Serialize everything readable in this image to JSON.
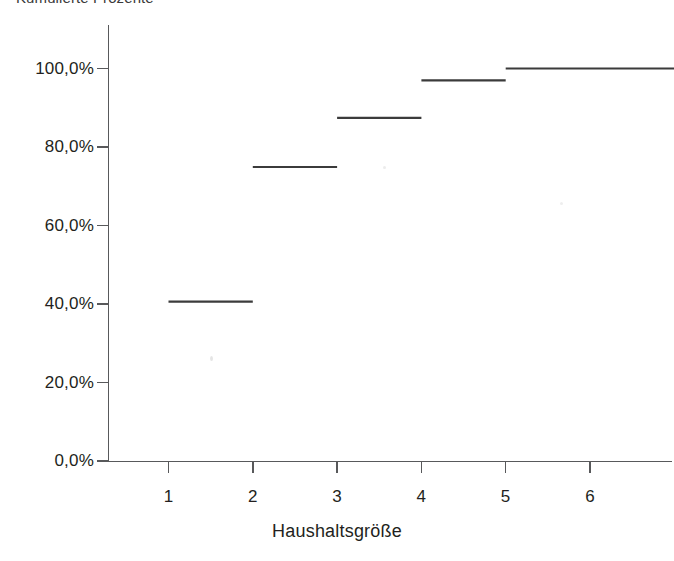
{
  "chart_data": {
    "type": "line",
    "subtype": "step",
    "title": "Kumulierte Prozente",
    "xlabel": "Haushaltsgröße",
    "ylabel": "",
    "categories": [
      "1",
      "2",
      "3",
      "4",
      "5",
      "6"
    ],
    "values": [
      40.6,
      74.9,
      87.4,
      97.0,
      100.0,
      100.0
    ],
    "x": [
      1,
      2,
      3,
      4,
      5,
      6
    ],
    "xlim": [
      0.5,
      6.9
    ],
    "ylim": [
      0,
      106
    ],
    "grid": false,
    "legend": null,
    "y_ticks": [
      0,
      20,
      40,
      60,
      80,
      100
    ],
    "y_tick_labels": [
      "0,0%",
      "20,0%",
      "40,0%",
      "60,0%",
      "80,0%",
      "100,0%"
    ],
    "x_ticks": [
      1,
      2,
      3,
      4,
      5,
      6
    ],
    "x_tick_labels": [
      "1",
      "2",
      "3",
      "4",
      "5",
      "6"
    ],
    "series_color": "#3b3b3b",
    "axis_color": "#58595b",
    "background_color": "#ffffff"
  },
  "axes": {
    "y_axis_name": "cumulative-percent-axis",
    "x_axis_name": "household-size-axis"
  }
}
